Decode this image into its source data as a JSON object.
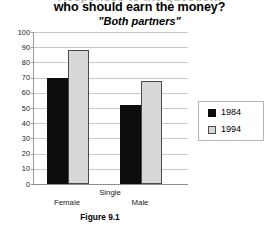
{
  "chart_data": {
    "type": "bar",
    "title": "who should earn the money?",
    "subtitle": "\"Both partners\"",
    "title_cutoff_ghost": "Responses to the question:",
    "categories": [
      "Female",
      "Male"
    ],
    "group_header": "Single",
    "series": [
      {
        "name": "1984",
        "values": [
          70,
          52
        ],
        "color": "#0d0d0d"
      },
      {
        "name": "1994",
        "values": [
          88,
          68
        ],
        "color": "#d8d8d8"
      }
    ],
    "xlabel": "",
    "ylabel": "",
    "ylim": [
      0,
      100
    ],
    "yticks": [
      0,
      10,
      20,
      30,
      40,
      50,
      60,
      70,
      80,
      90,
      100
    ],
    "grid": true,
    "legend_position": "right",
    "caption": "Figure 9.1"
  },
  "legend": {
    "entries": [
      {
        "label": "1984",
        "swatch": "black-square-swatch"
      },
      {
        "label": "1994",
        "swatch": "gray-square-swatch"
      }
    ]
  }
}
